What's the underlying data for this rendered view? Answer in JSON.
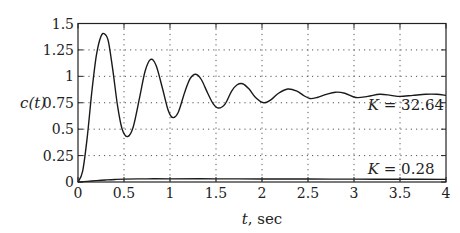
{
  "chart_data": {
    "type": "line",
    "title": "",
    "xlabel": "t, sec",
    "xlabel_var": "t",
    "xlabel_unit": ", sec",
    "ylabel": "c(t)",
    "xlim": [
      0,
      4
    ],
    "ylim": [
      0,
      1.5
    ],
    "grid": true,
    "legend": "none (inline annotations)",
    "x_ticks": [
      "0",
      "0.5",
      "1",
      "1.5",
      "2",
      "2.5",
      "3",
      "3.5",
      "4"
    ],
    "y_ticks": [
      "0",
      "0.25",
      "0.5",
      "0.75",
      "1",
      "1.25",
      "1.5"
    ],
    "annotations": [
      {
        "text": "K = 32.64",
        "x": 3.15,
        "y": 0.68
      },
      {
        "text": "K = 0.28",
        "x": 3.15,
        "y": 0.08
      }
    ],
    "series": [
      {
        "name": "K = 32.64",
        "x": [
          0,
          0.05,
          0.1,
          0.15,
          0.2,
          0.25,
          0.29,
          0.33,
          0.38,
          0.43,
          0.48,
          0.54,
          0.6,
          0.67,
          0.73,
          0.79,
          0.85,
          0.92,
          0.98,
          1.03,
          1.09,
          1.16,
          1.22,
          1.28,
          1.34,
          1.41,
          1.47,
          1.53,
          1.6,
          1.67,
          1.73,
          1.79,
          1.86,
          1.93,
          2.02,
          2.1,
          2.18,
          2.28,
          2.38,
          2.45,
          2.52,
          2.6,
          2.7,
          2.8,
          2.9,
          3.02,
          3.15,
          3.28,
          3.4,
          3.5,
          3.64,
          3.78,
          3.9,
          4.0
        ],
        "values": [
          0,
          0.1,
          0.42,
          0.85,
          1.2,
          1.38,
          1.4,
          1.33,
          1.05,
          0.72,
          0.5,
          0.43,
          0.52,
          0.8,
          1.05,
          1.16,
          1.1,
          0.88,
          0.68,
          0.61,
          0.66,
          0.85,
          0.98,
          1.02,
          0.97,
          0.84,
          0.74,
          0.7,
          0.74,
          0.86,
          0.92,
          0.93,
          0.88,
          0.8,
          0.75,
          0.78,
          0.84,
          0.88,
          0.86,
          0.82,
          0.79,
          0.8,
          0.83,
          0.85,
          0.84,
          0.8,
          0.81,
          0.83,
          0.82,
          0.81,
          0.82,
          0.83,
          0.83,
          0.82
        ]
      },
      {
        "name": "K = 0.28",
        "x": [
          0,
          0.1,
          0.2,
          0.3,
          0.4,
          0.5,
          0.75,
          1.0,
          1.5,
          2.0,
          2.5,
          3.0,
          3.5,
          4.0
        ],
        "values": [
          0,
          0.006,
          0.013,
          0.019,
          0.024,
          0.027,
          0.03,
          0.03,
          0.03,
          0.029,
          0.028,
          0.027,
          0.026,
          0.025
        ]
      }
    ]
  }
}
